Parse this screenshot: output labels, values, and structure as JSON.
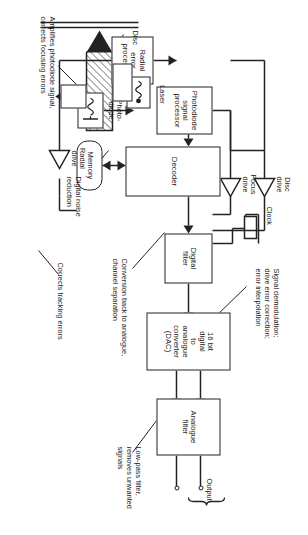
{
  "figure": {
    "orientation": "rotated-90"
  },
  "blocks": {
    "analogue_filter": "Analogue\nfilter",
    "dac": "16 bit\ndigital\nto\nanalogue\nconverter\n(DAC)",
    "digital_filter": "Digital\nfilter",
    "decoder": "Decoder",
    "memory": "Memory",
    "photodiode_processor": "Photodiode\nsignal\nprocessor",
    "radial_error_processor": "Radial\nerror\nprocessor",
    "photodiode": "Photo-\ndiode",
    "laser": "Laser"
  },
  "labels": {
    "output": "Output",
    "clock": "Clock",
    "disc": "Disc",
    "disc_drive": "Disc\ndrive",
    "focus_drive": "Focus\ndrive",
    "radial_drive": "Radial\ndrive"
  },
  "annotations": {
    "conversion": "Conversion back to analogue,\nchannel separation",
    "lowpass": "Low-pass filter,\nremoves unwanted\nsignals",
    "demodulation": "Signal demodulation;\ndrive error correction;\nerror interpolation",
    "noise_reduction": "Digital noise\nreduction",
    "amplifies": "Amplifies photodiode signal,\ncorrects focusing errors",
    "tracking": "Corrects tracking errors"
  },
  "colors": {
    "line": "#222222",
    "background": "#ffffff",
    "text": "#1a1a1a"
  }
}
